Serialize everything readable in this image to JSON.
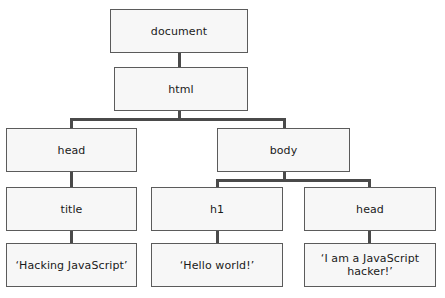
{
  "diagram": {
    "type": "dom-tree",
    "title": "",
    "nodes": {
      "document": {
        "label": "document"
      },
      "html": {
        "label": "html"
      },
      "head": {
        "label": "head"
      },
      "body": {
        "label": "body"
      },
      "title": {
        "label": "title"
      },
      "h1": {
        "label": "h1"
      },
      "head2": {
        "label": "head"
      },
      "title_text": {
        "label": "‘Hacking JavaScript’"
      },
      "h1_text": {
        "label": "‘Hello world!’"
      },
      "head2_text": {
        "label": "‘I am a JavaScript\nhacker!’"
      }
    },
    "edges": [
      {
        "from": "document",
        "to": "html"
      },
      {
        "from": "html",
        "to": "head"
      },
      {
        "from": "html",
        "to": "body"
      },
      {
        "from": "head",
        "to": "title"
      },
      {
        "from": "body",
        "to": "h1"
      },
      {
        "from": "body",
        "to": "head2"
      },
      {
        "from": "title",
        "to": "title_text"
      },
      {
        "from": "h1",
        "to": "h1_text"
      },
      {
        "from": "head2",
        "to": "head2_text"
      }
    ],
    "colors": {
      "node_fill": "#f7f7f7",
      "node_border": "#5b5b5b",
      "connector": "#4a4a4a",
      "text": "#1a1a1a",
      "background": "#ffffff"
    }
  }
}
